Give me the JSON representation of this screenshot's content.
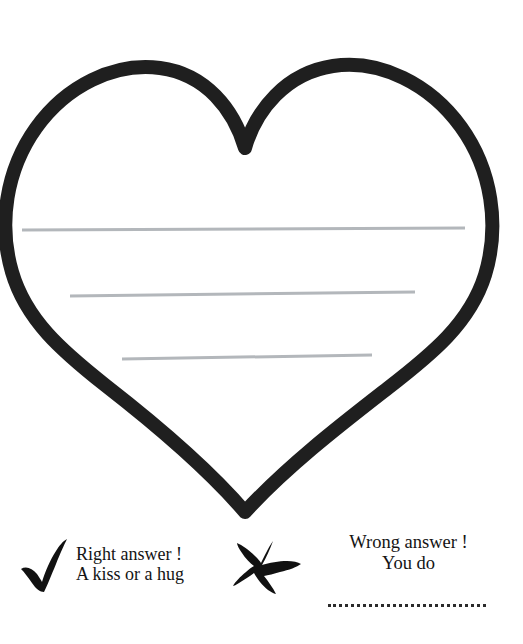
{
  "page": {
    "background_color": "#ffffff",
    "ink_color": "#1c1c1c",
    "rule_line_color": "#b3b7bb"
  },
  "heart": {
    "name": "heart-outline",
    "stroke_color": "#1f1f1f",
    "stroke_width": 14,
    "fill": "none",
    "writing_lines": [
      {
        "label": "writing-line-1",
        "x1": 22,
        "y1": 230,
        "x2": 465,
        "y2": 228,
        "thickness": 3
      },
      {
        "label": "writing-line-2",
        "x1": 70,
        "y1": 296,
        "x2": 415,
        "y2": 292,
        "thickness": 3
      },
      {
        "label": "writing-line-3",
        "x1": 122,
        "y1": 359,
        "x2": 372,
        "y2": 355,
        "thickness": 3
      }
    ]
  },
  "answers": {
    "right": {
      "icon": "check-mark-icon",
      "icon_color": "#111111",
      "line_1": "Right answer !",
      "line_2": "A kiss or a hug"
    },
    "wrong": {
      "icon": "x-mark-icon",
      "icon_color": "#111111",
      "line_1": "Wrong answer !",
      "line_2": "You do",
      "fill_in_blank": "dotted-blank-line"
    }
  }
}
